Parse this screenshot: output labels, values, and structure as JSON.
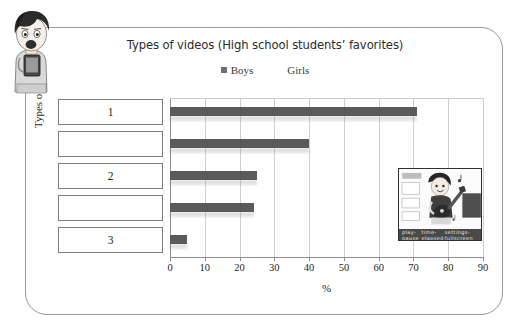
{
  "chart_data": {
    "type": "bar",
    "orientation": "horizontal",
    "title": "Types of videos (High school students’ favorites)",
    "xlabel": "%",
    "ylabel": "Types of videos",
    "xlim": [
      0,
      90
    ],
    "xticks": [
      0,
      10,
      20,
      30,
      40,
      50,
      60,
      70,
      80,
      90
    ],
    "grid": true,
    "legend": {
      "position": "top-center",
      "entries": [
        {
          "label": "Boys",
          "swatch": "filled"
        },
        {
          "label": "Girls",
          "swatch": "blank"
        }
      ]
    },
    "categories": [
      "1",
      "",
      "2",
      "",
      "3"
    ],
    "values": [
      71,
      40,
      25,
      24,
      5
    ],
    "series": [
      {
        "name": "Boys",
        "values": [
          71,
          40,
          25,
          24,
          5
        ]
      }
    ]
  },
  "panel": {
    "answer_boxes": [
      {
        "label": "1",
        "value": 71
      },
      {
        "label": "",
        "value": 40
      },
      {
        "label": "2",
        "value": 25
      },
      {
        "label": "",
        "value": 24
      },
      {
        "label": "3",
        "value": 5
      }
    ]
  },
  "mascot": {
    "name": "student-with-tablet-illustration"
  },
  "thumbnail": {
    "name": "video-player-thumbnail",
    "subject": "person-playing-guitar",
    "controls_left": "play-pause",
    "controls_center": "time-elapsed",
    "controls_right": "settings-fullscreen"
  },
  "colors": {
    "bar": "#5a5a5a",
    "grid": "#cfcfcf",
    "axis": "#8d8d8d",
    "border": "#9a9a9a",
    "text": "#1d1d1d"
  }
}
